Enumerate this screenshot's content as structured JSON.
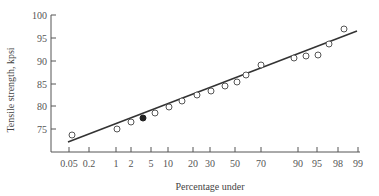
{
  "chart_data": {
    "type": "scatter",
    "title": "",
    "xlabel": "Percentage under",
    "ylabel": "Tensile strength, kpsi",
    "x_scale": "normal-probability",
    "x_ticks": [
      "0.05",
      "0.2",
      "1",
      "2",
      "5",
      "10",
      "20",
      "30",
      "50",
      "70",
      "90",
      "95",
      "98",
      "99"
    ],
    "y_ticks": [
      "75",
      "80",
      "85",
      "90",
      "95",
      "100"
    ],
    "ylim": [
      70,
      100
    ],
    "grid": false,
    "legend": null,
    "colors": {
      "axis": "#555555",
      "line": "#333333",
      "marker_edge": "#555555",
      "marker_fill_highlight": "#222222"
    },
    "series": [
      {
        "name": "observations",
        "marker": "open-circle",
        "points": [
          {
            "pct": 0.08,
            "y": 73.7,
            "filled": false
          },
          {
            "pct": 1.0,
            "y": 75.0,
            "filled": false
          },
          {
            "pct": 2.0,
            "y": 76.5,
            "filled": false
          },
          {
            "pct": 3.5,
            "y": 77.4,
            "filled": true
          },
          {
            "pct": 5.5,
            "y": 78.5,
            "filled": false
          },
          {
            "pct": 10.0,
            "y": 79.8,
            "filled": false
          },
          {
            "pct": 14.0,
            "y": 81.1,
            "filled": false
          },
          {
            "pct": 22.0,
            "y": 82.5,
            "filled": false
          },
          {
            "pct": 30.0,
            "y": 83.3,
            "filled": false
          },
          {
            "pct": 38.0,
            "y": 84.4,
            "filled": false
          },
          {
            "pct": 48.0,
            "y": 85.3,
            "filled": false
          },
          {
            "pct": 56.0,
            "y": 86.8,
            "filled": false
          },
          {
            "pct": 70.0,
            "y": 89.0,
            "filled": false
          },
          {
            "pct": 88.0,
            "y": 90.6,
            "filled": false
          },
          {
            "pct": 91.0,
            "y": 91.0,
            "filled": false
          },
          {
            "pct": 94.0,
            "y": 91.2,
            "filled": false
          },
          {
            "pct": 96.5,
            "y": 93.6,
            "filled": false
          },
          {
            "pct": 98.3,
            "y": 96.9,
            "filled": false
          }
        ]
      },
      {
        "name": "fit line",
        "type": "line",
        "points": [
          {
            "pct": 0.05,
            "y": 72.1
          },
          {
            "pct": 99.0,
            "y": 96.5
          }
        ]
      }
    ]
  },
  "layout": {
    "x_tick_px": [
      69,
      89,
      116,
      131,
      151,
      168,
      193,
      210,
      235,
      261,
      298,
      317,
      338,
      358
    ],
    "y_tick_px": [
      129,
      106,
      84,
      61,
      38,
      15
    ],
    "point_px": [
      [
        72,
        135
      ],
      [
        117,
        129
      ],
      [
        131,
        122
      ],
      [
        143,
        118
      ],
      [
        155,
        113
      ],
      [
        169,
        107
      ],
      [
        182,
        101
      ],
      [
        197,
        95
      ],
      [
        211,
        91
      ],
      [
        225,
        86
      ],
      [
        237,
        82
      ],
      [
        246,
        75
      ],
      [
        261,
        65
      ],
      [
        294,
        58
      ],
      [
        306,
        56
      ],
      [
        318,
        55
      ],
      [
        329,
        44
      ],
      [
        344,
        29
      ]
    ],
    "line_px": [
      [
        68,
        142
      ],
      [
        357,
        31
      ]
    ]
  }
}
